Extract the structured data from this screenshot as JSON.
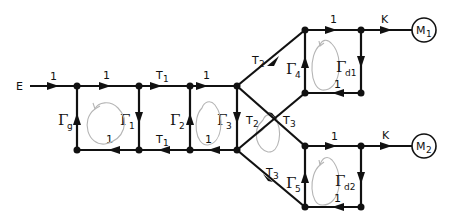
{
  "diagram": {
    "type": "signal-flow-graph",
    "input_label": "E",
    "outputs": [
      {
        "id": "M1",
        "label": "M",
        "sub": "1"
      },
      {
        "id": "M2",
        "label": "M",
        "sub": "2"
      }
    ],
    "edge_labels": {
      "e_in": "1",
      "top_1": "1",
      "top_T1": "T",
      "top_T1_sub": "1",
      "top_3": "1",
      "bottom_1": "1",
      "bottom_T1": "T",
      "bottom_T1_sub": "1",
      "bottom_3": "1",
      "upper_T2": "T",
      "upper_T2_sub": "2",
      "cross_T2": "T",
      "cross_T2_sub": "2",
      "cross_T3": "T",
      "cross_T3_sub": "3",
      "lower_T3": "T",
      "lower_T3_sub": "3",
      "upper_block_top": "1",
      "upper_block_bottom": "1",
      "upper_K": "K",
      "lower_block_top": "1",
      "lower_block_bottom": "1",
      "lower_K": "K"
    },
    "loop_labels": [
      {
        "id": "gamma_g",
        "symbol": "Γ",
        "sub": "g"
      },
      {
        "id": "gamma_1",
        "symbol": "Γ",
        "sub": "1"
      },
      {
        "id": "gamma_2",
        "symbol": "Γ",
        "sub": "2"
      },
      {
        "id": "gamma_3",
        "symbol": "Γ",
        "sub": "3"
      },
      {
        "id": "gamma_4",
        "symbol": "Γ",
        "sub": "4"
      },
      {
        "id": "gamma_5",
        "symbol": "Γ",
        "sub": "5"
      },
      {
        "id": "gamma_d1",
        "symbol": "Γ",
        "sub": "d1"
      },
      {
        "id": "gamma_d2",
        "symbol": "Γ",
        "sub": "d2"
      }
    ],
    "colors": {
      "line": "#111111",
      "loop_arrow": "#b5b5b5",
      "background": "#ffffff"
    }
  }
}
